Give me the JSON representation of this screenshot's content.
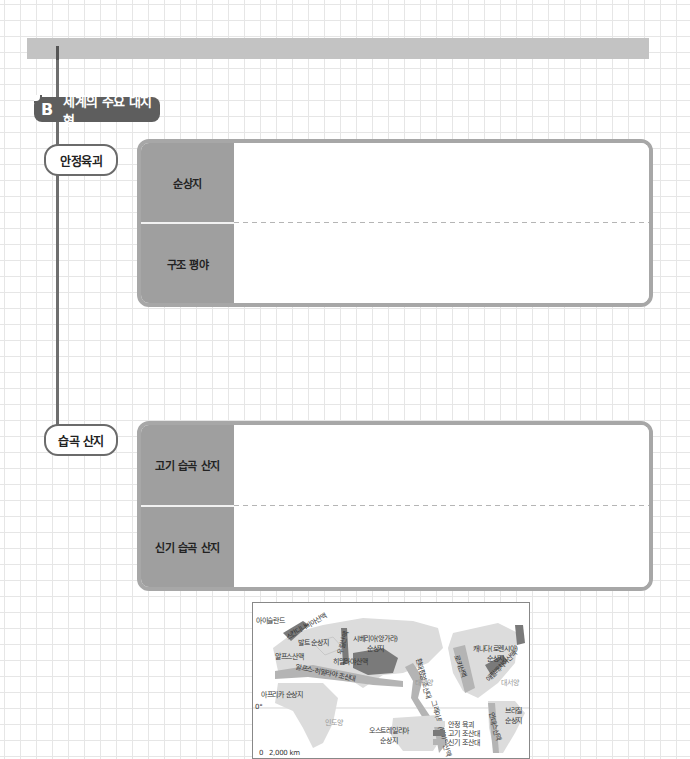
{
  "section": {
    "letter": "B",
    "title": "세계의 주요 대지형"
  },
  "groups": [
    {
      "label": "안정육괴",
      "rows": [
        {
          "label": "순상지",
          "content": ""
        },
        {
          "label": "구조 평야",
          "content": ""
        }
      ]
    },
    {
      "label": "습곡 산지",
      "rows": [
        {
          "label": "고기 습곡 산지",
          "content": ""
        },
        {
          "label": "신기 습곡 산지",
          "content": ""
        }
      ]
    }
  ],
  "map": {
    "labels": {
      "iceland": "아이슬란드",
      "scandinavia": "스칸디나비아산맥",
      "baltic": "발트 순상지",
      "ural": "우랄산맥",
      "siberia": "시베리아(앙가라)\n순상지",
      "alps": "알프스산맥",
      "himalaya": "히말라야산맥",
      "alps_himalaya": "알프스-히말라야 조산대",
      "africa": "아프리카 순상지",
      "circum_pacific": "환태평양 조산대",
      "canada": "캐나다(로렌시아)\n순상지",
      "rocky": "로키산맥",
      "appalachian": "애팔래치아산맥",
      "andes": "안데스산맥",
      "brazil": "브라질\n순상지",
      "australia": "오스트레일리아\n순상지",
      "great_dividing": "그레이트디바이딩산맥",
      "pacific": "태평양",
      "atlantic": "대서양",
      "indian": "인도양",
      "equator": "0°",
      "scale": "0   2,000 km"
    },
    "legend": [
      {
        "label": "안정 육괴",
        "color": "#dcdcdc"
      },
      {
        "label": "고기 조산대",
        "color": "#7a7a7a"
      },
      {
        "label": "신기 조산대",
        "color": "#b4b4b4"
      }
    ]
  }
}
